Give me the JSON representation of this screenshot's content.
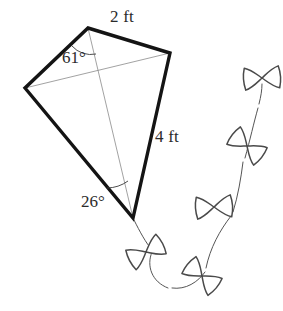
{
  "figure": {
    "type": "geometry-diagram",
    "background_color": "#ffffff",
    "outline_color": "#141414",
    "diagonal_color": "#8a8a8a",
    "text_color": "#2b2b2b",
    "tail_color": "#4a4a4a"
  },
  "labels": {
    "side_top_right": "2 ft",
    "side_bottom_right": "4 ft",
    "angle_top": "61°",
    "angle_bottom": "26°"
  },
  "geometry": {
    "vertices": {
      "top": {
        "x": 88,
        "y": 28,
        "name": "top-vertex"
      },
      "left": {
        "x": 25,
        "y": 88,
        "name": "left-vertex"
      },
      "right": {
        "x": 170,
        "y": 53,
        "name": "right-vertex"
      },
      "bottom": {
        "x": 133,
        "y": 218,
        "name": "bottom-vertex"
      }
    },
    "outline_path": "M 88 28 L 170 53 L 133 218 L 25 88 Z",
    "diagonal_horizontal": "M 25 88 L 170 53",
    "diagonal_vertical": "M 88 28 L 133 218",
    "angle_arc_top": "M 72 46 A 25 25 0 0 0 96 54",
    "angle_arc_bottom": "M 107 188 A 37 37 0 0 0 128 181",
    "outline_stroke_width": 3.4,
    "diagonal_stroke_width": 0.8
  },
  "tail": {
    "string_segments": [
      "M 134 220 C 140 232 146 243 152 250",
      "M 152 252 C 146 266 152 282 168 288",
      "M 172 288 C 186 290 198 282 205 272",
      "M 206 268 C 210 248 220 230 231 216",
      "M 233 212 C 238 196 241 178 243 162",
      "M 245 158 C 250 140 254 122 258 108",
      "M 259 104 C 261 96 262 90 262 84"
    ],
    "bows": [
      {
        "name": "bow-1",
        "cx": 146,
        "cy": 252,
        "rotation": -28,
        "scale": 1.0
      },
      {
        "name": "bow-2",
        "cx": 202,
        "cy": 276,
        "rotation": 40,
        "scale": 1.0
      },
      {
        "name": "bow-3",
        "cx": 214,
        "cy": 207,
        "rotation": -4,
        "scale": 1.0
      },
      {
        "name": "bow-4",
        "cx": 247,
        "cy": 146,
        "rotation": 38,
        "scale": 1.0
      },
      {
        "name": "bow-5",
        "cx": 262,
        "cy": 78,
        "rotation": -4,
        "scale": 1.0
      }
    ],
    "bow_path": "M -17 -11 C -10 -9 -5 -4 0 0 C 5 -4 10 -9 17 -11 C 19 -4 19 4 17 11 C 10 9 5 4 0 0 C -5 4 -10 9 -17 11 C -19 4 -19 -4 -17 -11 Z"
  },
  "label_positions": {
    "side_top_right": {
      "x": 110,
      "y": 22
    },
    "side_bottom_right": {
      "x": 155,
      "y": 142
    },
    "angle_top": {
      "x": 62,
      "y": 63
    },
    "angle_bottom": {
      "x": 81,
      "y": 207
    }
  }
}
